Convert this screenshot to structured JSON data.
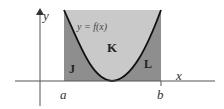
{
  "diagram": {
    "type": "area-under-curve",
    "curve_label": "y = f(x)",
    "axes": {
      "x_label": "x",
      "y_label": "y"
    },
    "bounds": {
      "left_label": "a",
      "right_label": "b"
    },
    "regions": [
      {
        "id": "J",
        "label": "J",
        "description": "area below curve near a"
      },
      {
        "id": "K",
        "label": "K",
        "description": "area above curve between a and b"
      },
      {
        "id": "L",
        "label": "L",
        "description": "area below curve near b"
      }
    ],
    "colors": {
      "light_fill": "#c9c9c9",
      "dark_fill": "#8e8e8e",
      "curve": "#111111",
      "axis": "#555555"
    }
  }
}
